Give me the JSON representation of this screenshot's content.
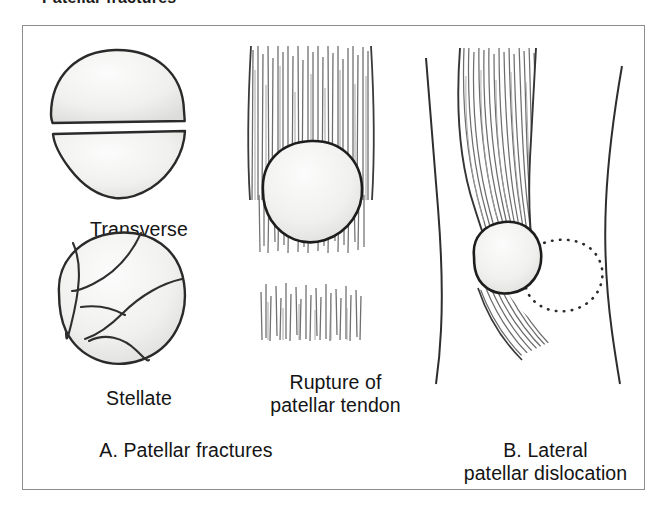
{
  "heading": "Patellar fractures",
  "figure": {
    "frame_color": "#8d8d8d",
    "background": "#ffffff",
    "ink_color": "#1a1a1a",
    "bone_fill": "#f2f2f0",
    "tendon_color": "#6e6e6e"
  },
  "labels": {
    "transverse": "Transverse",
    "stellate": "Stellate",
    "rupture": "Rupture of\npatellar tendon",
    "panel_a": "A. Patellar fractures",
    "panel_b": "B. Lateral\npatellar dislocation"
  },
  "illustrations": {
    "transverse_fracture": {
      "name": "transverse-patellar-fracture",
      "description": "Patella split horizontally into a superior and an inferior fragment separated by a gap",
      "fragments": 2
    },
    "stellate_fracture": {
      "name": "stellate-patellar-fracture",
      "description": "Comminuted patella with multiple irregular radiating fracture lines",
      "fragments": 4
    },
    "tendon_rupture": {
      "name": "patellar-tendon-rupture",
      "description": "Patella with quadriceps tendon above and a torn, retracted patellar tendon below leaving a gap",
      "gap": true
    },
    "lateral_dislocation": {
      "name": "lateral-patellar-dislocation",
      "description": "Knee in frontal view; solid patella in normal position with dotted outline showing laterally dislocated position",
      "dotted_outline": true
    }
  }
}
